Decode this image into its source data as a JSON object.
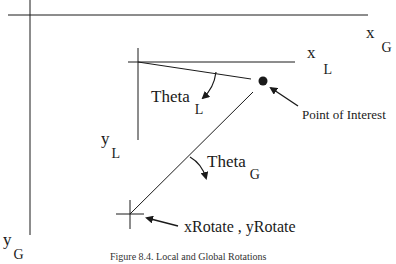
{
  "diagram": {
    "labels": {
      "x_global": {
        "main": "x",
        "sub": "G"
      },
      "y_global": {
        "main": "y",
        "sub": "G"
      },
      "x_local": {
        "main": "x",
        "sub": "L"
      },
      "y_local": {
        "main": "y",
        "sub": "L"
      },
      "theta_local": {
        "main": "Theta",
        "sub": "L"
      },
      "theta_global": {
        "main": "Theta",
        "sub": "G"
      },
      "point_of_interest": "Point of Interest",
      "rotate_origin": "xRotate , yRotate"
    },
    "caption": "Figure 8.4. Local and Global Rotations",
    "colors": {
      "line": "#1a1a1a",
      "background": "#ffffff"
    }
  }
}
